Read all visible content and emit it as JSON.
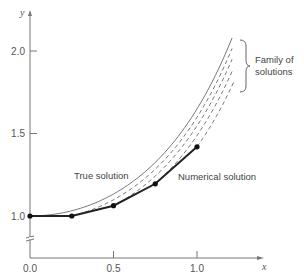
{
  "chart_data": {
    "type": "line",
    "title": "",
    "xlabel": "x",
    "ylabel": "y",
    "xlim": [
      0.0,
      1.2
    ],
    "ylim": [
      1.0,
      2.1
    ],
    "y_axis_break": true,
    "grid": false,
    "x_ticks": [
      {
        "value": 0.0,
        "label": "0.0"
      },
      {
        "value": 0.5,
        "label": "0.5"
      },
      {
        "value": 1.0,
        "label": "1.0"
      }
    ],
    "y_ticks": [
      {
        "value": 1.0,
        "label": "1.0"
      },
      {
        "value": 1.5,
        "label": "1.5"
      },
      {
        "value": 2.0,
        "label": "2.0"
      }
    ],
    "series": [
      {
        "name": "True solution",
        "style": "solid-thin",
        "function": "y = exp(x^2/2)",
        "x_range": [
          0.0,
          1.21
        ]
      },
      {
        "name": "Numerical solution",
        "style": "solid-bold-markers",
        "x": [
          0.0,
          0.25,
          0.5,
          0.75,
          1.0
        ],
        "y": [
          1.0,
          1.0,
          1.0625,
          1.1953,
          1.4194
        ]
      },
      {
        "name": "Family of solutions",
        "style": "dashed",
        "curves": [
          {
            "start_x": 0.25,
            "start_y": 1.0,
            "end_x": 1.21
          },
          {
            "start_x": 0.5,
            "start_y": 1.0625,
            "end_x": 1.21
          },
          {
            "start_x": 0.75,
            "start_y": 1.1953,
            "end_x": 1.21
          },
          {
            "start_x": 1.0,
            "start_y": 1.4194,
            "end_x": 1.22
          }
        ]
      }
    ],
    "annotations": {
      "true_solution": "True solution",
      "numerical_solution": "Numerical solution",
      "family_line1": "Family of",
      "family_line2": "solutions"
    }
  }
}
